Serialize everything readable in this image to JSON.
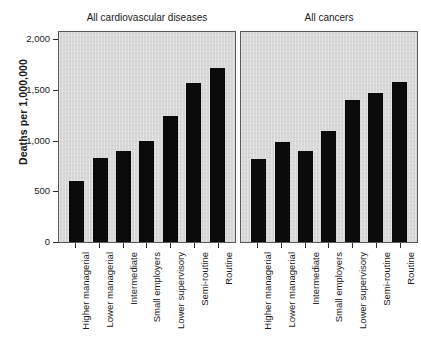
{
  "chart_data": {
    "type": "bar",
    "title": "",
    "xlabel": "",
    "ylabel": "Deaths per 1,000,000",
    "ylim": [
      0,
      2000
    ],
    "yticks": [
      "0",
      "500",
      "1,000",
      "1,500",
      "2,000"
    ],
    "ytick_values": [
      0,
      500,
      1000,
      1500,
      2000
    ],
    "grid": false,
    "legend": null,
    "categories": [
      "Higher managerial",
      "Lower managerial",
      "Intermediate",
      "Small employers",
      "Lower supervisory",
      "Semi-routine",
      "Routine"
    ],
    "panels": [
      {
        "title": "All cardiovascular diseases",
        "values": [
          600,
          830,
          900,
          1000,
          1240,
          1570,
          1710
        ]
      },
      {
        "title": "All cancers",
        "values": [
          820,
          990,
          900,
          1090,
          1400,
          1470,
          1580
        ]
      }
    ],
    "bar_color": "#0b0b0b",
    "panel_background": "#d8d8d8"
  }
}
